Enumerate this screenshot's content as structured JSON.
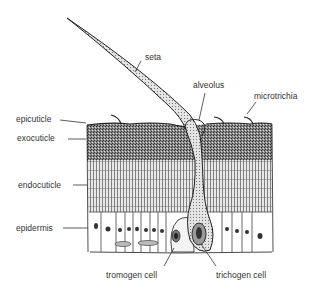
{
  "diagram": {
    "type": "anatomical cross-section",
    "labels": {
      "seta": "seta",
      "alveolus": "alveolus",
      "microtrichia": "microtrichia",
      "epicuticle": "epicuticle",
      "exocuticle": "exocuticle",
      "endocuticle": "endocuticle",
      "epidermis": "epidermis",
      "tromogen_cell": "tromogen cell",
      "trichogen_cell": "trichogen cell"
    },
    "colors": {
      "line": "#2a2a2a",
      "text": "#333333",
      "background": "#ffffff"
    }
  }
}
